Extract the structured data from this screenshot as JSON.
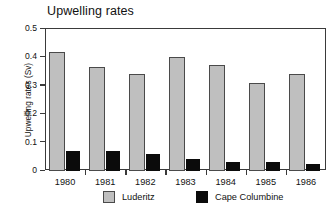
{
  "chart_data": {
    "type": "bar",
    "title": "Upwelling rates",
    "xlabel": "",
    "ylabel": "Upwelling rates (Sv)",
    "categories": [
      "1980",
      "1981",
      "1982",
      "1983",
      "1984",
      "1985",
      "1986"
    ],
    "series": [
      {
        "name": "Luderitz",
        "color": "#bfbfbf",
        "values": [
          0.42,
          0.365,
          0.34,
          0.4,
          0.372,
          0.31,
          0.34
        ]
      },
      {
        "name": "Cape Columbine",
        "color": "#0b0b0b",
        "values": [
          0.07,
          0.07,
          0.06,
          0.043,
          0.033,
          0.03,
          0.025
        ]
      }
    ],
    "ylim": [
      0,
      0.5
    ],
    "yticks": [
      "0",
      "0.1",
      "0.2",
      "0.3",
      "0.4",
      "0.5"
    ],
    "ytick_values": [
      0,
      0.1,
      0.2,
      0.3,
      0.4,
      0.5
    ],
    "grid": false,
    "legend_position": "bottom"
  }
}
